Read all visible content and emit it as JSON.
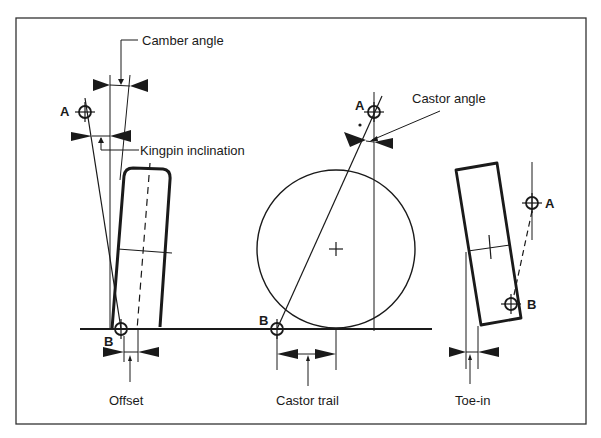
{
  "diagram": {
    "colors": {
      "ink": "#1a1a1a",
      "background": "#ffffff",
      "frame": "#333333"
    },
    "labels": {
      "camber_angle": "Camber angle",
      "kingpin_inclination": "Kingpin inclination",
      "castor_angle": "Castor angle",
      "offset": "Offset",
      "castor_trail": "Castor trail",
      "toe_in": "Toe-in"
    },
    "points": {
      "left_A": "A",
      "left_B": "B",
      "middle_A": "A",
      "middle_B": "B",
      "right_A": "A",
      "right_B": "B"
    },
    "panels": [
      {
        "name": "front-view",
        "caption": "Offset"
      },
      {
        "name": "side-view",
        "caption": "Castor trail"
      },
      {
        "name": "top-view",
        "caption": "Toe-in"
      }
    ]
  }
}
